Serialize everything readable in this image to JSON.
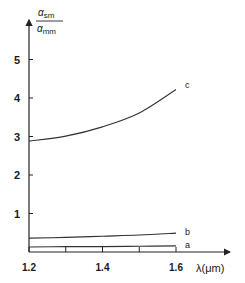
{
  "chart_data": {
    "type": "line",
    "title": "",
    "xlabel": "λ(μm)",
    "ylabel": {
      "numerator": "α",
      "numerator_sub": "sm",
      "denominator": "α",
      "denominator_sub": "mm"
    },
    "xlim": [
      1.2,
      1.65
    ],
    "ylim": [
      0,
      5.7
    ],
    "x_ticks": [
      1.2,
      1.3,
      1.4,
      1.5,
      1.6
    ],
    "x_tick_labels": [
      "1.2",
      "",
      "1.4",
      "",
      "1.6"
    ],
    "y_ticks": [
      1,
      2,
      3,
      4,
      5
    ],
    "y_tick_labels": [
      "1",
      "2",
      "3",
      "4",
      "5"
    ],
    "grid": false,
    "legend": "inline-labels-right",
    "x": [
      1.2,
      1.3,
      1.4,
      1.5,
      1.6
    ],
    "series": [
      {
        "name": "a",
        "values": [
          0.13,
          0.14,
          0.14,
          0.15,
          0.16
        ]
      },
      {
        "name": "b",
        "values": [
          0.36,
          0.38,
          0.41,
          0.44,
          0.49
        ]
      },
      {
        "name": "c",
        "values": [
          2.88,
          3.01,
          3.25,
          3.61,
          4.22
        ]
      }
    ]
  }
}
